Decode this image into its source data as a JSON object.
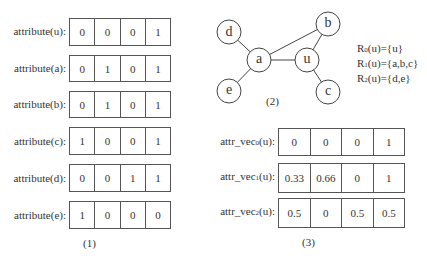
{
  "panel1": {
    "caption": "(1)",
    "rows": [
      {
        "label": "attribute(u):",
        "values": [
          "0",
          "0",
          "0",
          "1"
        ]
      },
      {
        "label": "attribute(a):",
        "values": [
          "0",
          "1",
          "0",
          "1"
        ]
      },
      {
        "label": "attribute(b):",
        "values": [
          "0",
          "1",
          "0",
          "1"
        ]
      },
      {
        "label": "attribute(c):",
        "values": [
          "1",
          "0",
          "0",
          "1"
        ]
      },
      {
        "label": "attribute(d):",
        "values": [
          "0",
          "0",
          "1",
          "1"
        ]
      },
      {
        "label": "attribute(e):",
        "values": [
          "1",
          "0",
          "0",
          "0"
        ]
      }
    ]
  },
  "panel2": {
    "caption": "(2)",
    "nodes": [
      {
        "id": "d",
        "label": "d"
      },
      {
        "id": "b",
        "label": "b"
      },
      {
        "id": "a",
        "label": "a"
      },
      {
        "id": "u",
        "label": "u"
      },
      {
        "id": "e",
        "label": "e"
      },
      {
        "id": "c",
        "label": "c"
      }
    ],
    "edges": [
      [
        "d",
        "a"
      ],
      [
        "e",
        "a"
      ],
      [
        "a",
        "u"
      ],
      [
        "a",
        "b"
      ],
      [
        "u",
        "b"
      ],
      [
        "u",
        "c"
      ]
    ],
    "sets": [
      {
        "name": "R",
        "sub": "0",
        "text": "(u)={u}"
      },
      {
        "name": "R",
        "sub": "1",
        "text": "(u)={a,b,c}"
      },
      {
        "name": "R",
        "sub": "2",
        "text": "(u)={d,e}"
      }
    ]
  },
  "panel3": {
    "caption": "(3)",
    "rows": [
      {
        "label_pre": "attr_vec",
        "label_sub": "0",
        "label_post": "(u):",
        "values": [
          "0",
          "0",
          "0",
          "1"
        ]
      },
      {
        "label_pre": "attr_vec",
        "label_sub": "1",
        "label_post": "(u):",
        "values": [
          "0.33",
          "0.66",
          "0",
          "1"
        ]
      },
      {
        "label_pre": "attr_vec",
        "label_sub": "2",
        "label_post": "(u):",
        "values": [
          "0.5",
          "0",
          "0.5",
          "0.5"
        ]
      }
    ]
  }
}
